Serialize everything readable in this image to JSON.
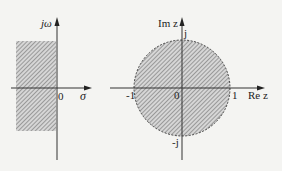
{
  "left_plane": {
    "y_axis_label": "jω",
    "x_axis_label": "σ",
    "origin_label": "0",
    "region": "left half-plane (Re s < 0), hatched"
  },
  "right_plane": {
    "y_axis_label": "Im z",
    "x_axis_label": "Re z",
    "origin_label": "0",
    "tick_neg_one": "-1",
    "tick_one": "1",
    "tick_j": "j",
    "tick_neg_j": "-j",
    "region": "interior of unit circle (|z| < 1), hatched, dashed boundary"
  },
  "colors": {
    "background": "#f4f4f2",
    "axis": "#333333",
    "hatch": "#555555",
    "region_fill": "#d8d8d8"
  }
}
